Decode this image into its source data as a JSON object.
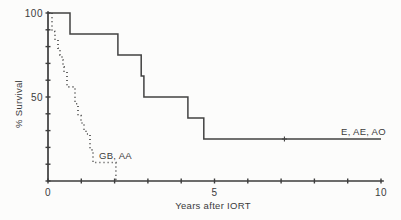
{
  "figure": {
    "background": "#fcfcfb",
    "ink_color": "#3d3d3d"
  },
  "chart_data": {
    "type": "line",
    "subtype": "kaplan-meier-survival-steps",
    "title": "",
    "xlabel": "Years after IORT",
    "ylabel": "% Survival",
    "xlim": [
      0,
      10
    ],
    "ylim": [
      0,
      100
    ],
    "grid": false,
    "legend_position": "inline-labels-on-plot",
    "x_ticks": [
      0,
      1,
      2,
      3,
      4,
      5,
      6,
      7,
      8,
      9,
      10
    ],
    "x_tick_labels": [
      {
        "v": 0,
        "label": "0"
      },
      {
        "v": 5,
        "label": "5"
      },
      {
        "v": 10,
        "label": "10"
      }
    ],
    "y_ticks": [
      0,
      10,
      20,
      30,
      40,
      50,
      60,
      70,
      80,
      90,
      100
    ],
    "y_tick_labels": [
      {
        "v": 50,
        "label": "50"
      },
      {
        "v": 100,
        "label": "100"
      }
    ],
    "series": [
      {
        "id": "e-ae-ao",
        "label": "E, AE, AO",
        "line_style": "solid",
        "points": [
          [
            0,
            100
          ],
          [
            0.66,
            100
          ],
          [
            0.66,
            87.5
          ],
          [
            2.1,
            87.5
          ],
          [
            2.1,
            75
          ],
          [
            2.8,
            75
          ],
          [
            2.8,
            62.5
          ],
          [
            2.88,
            62.5
          ],
          [
            2.88,
            50
          ],
          [
            4.2,
            50
          ],
          [
            4.2,
            37.5
          ],
          [
            4.68,
            37.5
          ],
          [
            4.68,
            25
          ],
          [
            10,
            25
          ]
        ],
        "censor_marks": [
          [
            7.1,
            25
          ]
        ]
      },
      {
        "id": "gb-aa",
        "label": "GB, AA",
        "line_style": "dotted",
        "points": [
          [
            0,
            100
          ],
          [
            0.12,
            100
          ],
          [
            0.12,
            89
          ],
          [
            0.21,
            89
          ],
          [
            0.21,
            84
          ],
          [
            0.3,
            84
          ],
          [
            0.3,
            79
          ],
          [
            0.36,
            79
          ],
          [
            0.36,
            75
          ],
          [
            0.42,
            75
          ],
          [
            0.42,
            72
          ],
          [
            0.45,
            72
          ],
          [
            0.45,
            68
          ],
          [
            0.48,
            68
          ],
          [
            0.48,
            65
          ],
          [
            0.57,
            65
          ],
          [
            0.57,
            56
          ],
          [
            0.81,
            56
          ],
          [
            0.81,
            46
          ],
          [
            0.9,
            46
          ],
          [
            0.9,
            39
          ],
          [
            0.99,
            39
          ],
          [
            0.99,
            34.5
          ],
          [
            1.08,
            34.5
          ],
          [
            1.08,
            30
          ],
          [
            1.14,
            30
          ],
          [
            1.14,
            28
          ],
          [
            1.26,
            28
          ],
          [
            1.26,
            18.5
          ],
          [
            1.35,
            18.5
          ],
          [
            1.35,
            11
          ],
          [
            2.04,
            11
          ],
          [
            2.04,
            0
          ]
        ],
        "censor_marks": []
      }
    ]
  }
}
